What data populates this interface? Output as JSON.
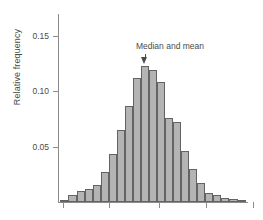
{
  "chart_data": {
    "type": "bar",
    "title": "",
    "subtitle": "",
    "xlabel": "",
    "ylabel": "Relative frequency",
    "ylim": [
      0,
      0.1695
    ],
    "xlim": [
      0,
      23
    ],
    "grid": false,
    "legend": null,
    "y_ticks": [
      {
        "value": 0.05,
        "label": "0.05"
      },
      {
        "value": 0.1,
        "label": "0.10"
      },
      {
        "value": 0.15,
        "label": "0.15"
      }
    ],
    "x_ticks": [
      {
        "position": 0.63,
        "label": ""
      },
      {
        "position": 6.23,
        "label": ""
      },
      {
        "position": 12.2,
        "label": ""
      },
      {
        "position": 17.9,
        "label": ""
      },
      {
        "position": 23.6,
        "label": ""
      }
    ],
    "categories": [
      "b1",
      "b2",
      "b3",
      "b4",
      "b5",
      "b6",
      "b7",
      "b8",
      "b9",
      "b10",
      "b11",
      "b12",
      "b13",
      "b14",
      "b15",
      "b16",
      "b17",
      "b18",
      "b19",
      "b20",
      "b21",
      "b22",
      "b23"
    ],
    "values": [
      0.002,
      0.006,
      0.01,
      0.012,
      0.015,
      0.027,
      0.043,
      0.065,
      0.087,
      0.112,
      0.123,
      0.119,
      0.108,
      0.076,
      0.072,
      0.046,
      0.03,
      0.017,
      0.008,
      0.006,
      0.004,
      0.003,
      0.002
    ],
    "annotations": [
      {
        "text": "Median and mean",
        "points_to_category": "b11",
        "points_to_value": 0.123,
        "arrow": true
      }
    ],
    "colors": {
      "bar_fill": "#b4b4b4",
      "bar_edge": "#636363",
      "axis": "#8c8c8c",
      "text": "#4a4a4a",
      "background": "#ffffff"
    }
  }
}
